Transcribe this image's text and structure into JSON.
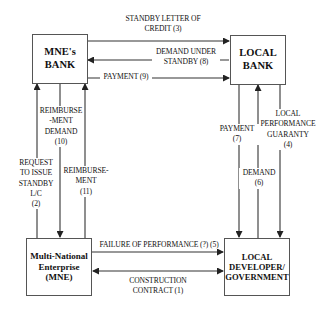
{
  "diagram": {
    "type": "flow",
    "nodes": {
      "mne_bank": "MNE's\nBANK",
      "local_bank": "LOCAL\nBANK",
      "mne": "Multi-National\nEnterprise\n(MNE)",
      "local_developer": "LOCAL\nDEVELOPER/\nGOVERNMENT"
    },
    "edges": {
      "standby_letter": "STANDBY LETTER OF\nCREDIT (3)",
      "demand_under_standby": "DEMAND UNDER\nSTANDBY (8)",
      "payment_9": "PAYMENT (9)",
      "reimbursement_demand": "REIMBURSE\n-MENT\nDEMAND\n(10)",
      "request_issue": "REQUEST\nTO ISSUE\nSTANDBY\nL/C\n(2)",
      "reimbursement": "REIMBURSE-\nMENT\n(11)",
      "payment_7": "PAYMENT\n(7)",
      "demand_6": "DEMAND\n(6)",
      "local_guaranty": "LOCAL\nPERFORMANCE\nGUARANTY\n(4)",
      "failure": "FAILURE OF PERFORMANCE (?) (5)",
      "construction_contract": "CONSTRUCTION\nCONTRACT (1)"
    },
    "colors": {
      "line": "#333333",
      "border": "#555555",
      "text": "#111111"
    }
  }
}
